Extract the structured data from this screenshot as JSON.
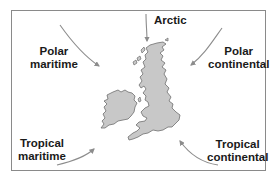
{
  "diagram": {
    "frame_color": "#8a8a8a",
    "land_fill": "#c8c8c8",
    "land_stroke": "#6e6e6e",
    "arrow_color": "#8c8c8c",
    "air_masses": [
      {
        "id": "arctic",
        "line1": "Arctic",
        "line2": ""
      },
      {
        "id": "polar-maritime",
        "line1": "Polar",
        "line2": "maritime"
      },
      {
        "id": "polar-continental",
        "line1": "Polar",
        "line2": "continental"
      },
      {
        "id": "tropical-maritime",
        "line1": "Tropical",
        "line2": "maritime"
      },
      {
        "id": "tropical-continental",
        "line1": "Tropical",
        "line2": "continental"
      }
    ],
    "map_regions": [
      "Great Britain",
      "Ireland"
    ]
  }
}
